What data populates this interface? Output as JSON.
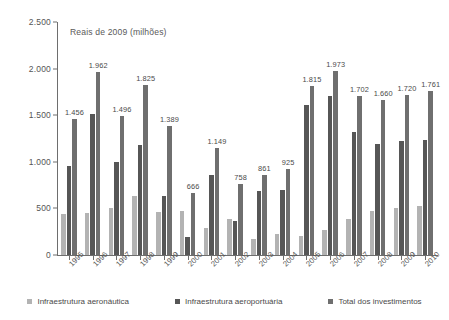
{
  "chart_data": {
    "type": "bar",
    "title": "",
    "subtitle": "",
    "axis_note": "Reais de 2009 (milhões)",
    "xlabel": "",
    "ylabel": "",
    "ylim": [
      0,
      2500
    ],
    "yticks": [
      "0",
      "500",
      "1.000",
      "1.500",
      "2.000",
      "2.500"
    ],
    "ytick_values": [
      0,
      500,
      1000,
      1500,
      2000,
      2500
    ],
    "grid": false,
    "legend_position": "bottom",
    "categories": [
      "1995",
      "1996",
      "1997",
      "1998",
      "1999",
      "2000",
      "2001",
      "2002",
      "2003",
      "2004",
      "2005",
      "2006",
      "2007",
      "2008",
      "2009",
      "2010"
    ],
    "series": [
      {
        "name": "Infraestrutura aeronáutica",
        "color": "#b3b3b3",
        "values": [
          440,
          450,
          505,
          630,
          465,
          470,
          290,
          390,
          175,
          230,
          205,
          270,
          385,
          470,
          500,
          530
        ]
      },
      {
        "name": "Infraestrutura aeroportuária",
        "color": "#565656",
        "values": [
          960,
          1512,
          995,
          1180,
          635,
          196,
          855,
          365,
          690,
          700,
          1610,
          1705,
          1320,
          1190,
          1220,
          1230
        ]
      },
      {
        "name": "Total dos investimentos",
        "color": "#6f6f6f",
        "values": [
          1456,
          1962,
          1496,
          1825,
          1389,
          666,
          1149,
          758,
          861,
          925,
          1815,
          1973,
          1702,
          1660,
          1720,
          1761
        ],
        "labels": [
          "1.456",
          "1.962",
          "1.496",
          "1.825",
          "1.389",
          "666",
          "1.149",
          "758",
          "861",
          "925",
          "1.815",
          "1.973",
          "1.702",
          "1.660",
          "1.720",
          "1.761"
        ]
      }
    ]
  },
  "legend": {
    "items": [
      {
        "label": "Infraestrutura aeronáutica",
        "color": "#b3b3b3"
      },
      {
        "label": "Infraestrutura aeroportuária",
        "color": "#565656"
      },
      {
        "label": "Total dos investimentos",
        "color": "#6f6f6f"
      }
    ]
  }
}
